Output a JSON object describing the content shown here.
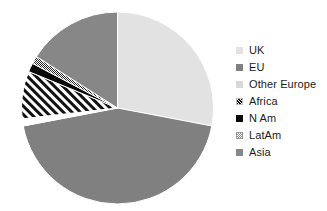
{
  "chart_data": {
    "type": "pie",
    "title": "",
    "labels": [
      "UK",
      "EU",
      "Other Europe",
      "Africa",
      "N Am",
      "LatAm",
      "Asia"
    ],
    "values": [
      28.0,
      44.0,
      1.2,
      8.0,
      1.5,
      1.3,
      16.0
    ],
    "units": "percent",
    "legend_position": "right",
    "start_angle_deg": 0,
    "direction": "clockwise",
    "grid": false,
    "slices": [
      {
        "label": "UK",
        "value": 28.0,
        "start_deg": 0.0,
        "end_deg": 100.8,
        "fill": "#e2e2e2",
        "pattern": "solid"
      },
      {
        "label": "EU",
        "value": 44.0,
        "start_deg": 100.8,
        "end_deg": 259.2,
        "fill": "#808080",
        "pattern": "solid"
      },
      {
        "label": "Other Europe",
        "value": 1.2,
        "start_deg": 259.2,
        "end_deg": 263.5,
        "fill": "#ffffff",
        "pattern": "solid"
      },
      {
        "label": "Africa",
        "value": 8.0,
        "start_deg": 263.5,
        "end_deg": 292.3,
        "fill": "#ffffff",
        "pattern": "diagonal-stripes"
      },
      {
        "label": "N Am",
        "value": 1.5,
        "start_deg": 292.3,
        "end_deg": 297.7,
        "fill": "#0a0a0a",
        "pattern": "solid"
      },
      {
        "label": "LatAm",
        "value": 1.3,
        "start_deg": 297.7,
        "end_deg": 302.4,
        "fill": "#ffffff",
        "pattern": "checker"
      },
      {
        "label": "Asia",
        "value": 16.0,
        "start_deg": 302.4,
        "end_deg": 360.0,
        "fill": "#878787",
        "pattern": "solid"
      }
    ]
  },
  "legend": {
    "items": [
      {
        "label": "UK",
        "color": "#e2e2e2",
        "pattern": "solid"
      },
      {
        "label": "EU",
        "color": "#808080",
        "pattern": "solid"
      },
      {
        "label": "Other Europe",
        "color": "#d8d8d8",
        "pattern": "solid"
      },
      {
        "label": "Africa",
        "color": "#bdbdbd",
        "pattern": "diagonal-stripes"
      },
      {
        "label": "N Am",
        "color": "#0a0a0a",
        "pattern": "solid"
      },
      {
        "label": "LatAm",
        "color": "#9a9a9a",
        "pattern": "checker"
      },
      {
        "label": "Asia",
        "color": "#878787",
        "pattern": "solid"
      }
    ]
  },
  "colors": {
    "background": "#ffffff",
    "text": "#1b1b1b",
    "slice_border": "#ffffff"
  }
}
